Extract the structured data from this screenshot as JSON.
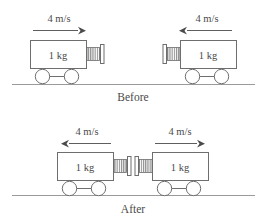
{
  "figure": {
    "title": "",
    "panels": [
      {
        "id": "before",
        "label": "Before",
        "carts": [
          {
            "id": "before-left-cart",
            "mass_label": "1 kg",
            "speed_label": "4 m/s",
            "direction": "right",
            "bumper": "spring-plate"
          },
          {
            "id": "before-right-cart",
            "mass_label": "1 kg",
            "speed_label": "4 m/s",
            "direction": "left",
            "bumper": "spring-plate"
          }
        ]
      },
      {
        "id": "after",
        "label": "After",
        "carts": [
          {
            "id": "after-left-cart",
            "mass_label": "1 kg",
            "speed_label": "4 m/s",
            "direction": "left",
            "bumper": "spring-plate"
          },
          {
            "id": "after-right-cart",
            "mass_label": "1 kg",
            "speed_label": "4 m/s",
            "direction": "right",
            "bumper": "spring-plate"
          }
        ]
      }
    ]
  },
  "colors": {
    "outline": "#6e6e6e",
    "ground": "#9a9a9a",
    "text": "#4a4a4a",
    "arrow": "#5e5e5e",
    "background": "#ffffff"
  },
  "icons": {
    "arrow_right": "arrow-right-icon",
    "arrow_left": "arrow-left-icon",
    "spring": "spring-icon",
    "wheel": "wheel-icon",
    "ground": "ground-line-icon"
  }
}
